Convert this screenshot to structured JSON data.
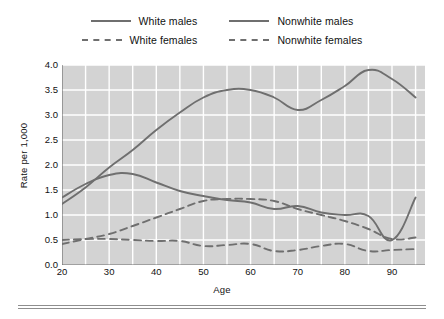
{
  "legend": {
    "entries": [
      {
        "label": "White males",
        "style": "solid"
      },
      {
        "label": "Nonwhite males",
        "style": "solid"
      },
      {
        "label": "White females",
        "style": "dashed"
      },
      {
        "label": "Nonwhite females",
        "style": "dashed"
      }
    ]
  },
  "axes": {
    "ylabel": "Rate per 1,000",
    "xlabel": "Age",
    "yticks": [
      "0.0",
      "0.5",
      "1.0",
      "1.5",
      "2.0",
      "2.5",
      "3.0",
      "3.5",
      "4.0"
    ],
    "xticks": [
      "20",
      "30",
      "40",
      "50",
      "60",
      "70",
      "80",
      "90"
    ]
  },
  "colors": {
    "line": "#6f6f6f",
    "plot_background": "#d3d3d3",
    "gridline": "#ffffff",
    "axis": "#6f6f6f",
    "text": "#111111"
  },
  "chart_data": {
    "type": "line",
    "title": "",
    "xlabel": "Age",
    "ylabel": "Rate per 1,000",
    "xlim": [
      20,
      97
    ],
    "ylim": [
      0.0,
      4.0
    ],
    "grid": true,
    "legend_position": "top",
    "x": [
      20,
      25,
      30,
      35,
      40,
      45,
      50,
      55,
      60,
      65,
      70,
      75,
      80,
      85,
      90,
      95
    ],
    "series": [
      {
        "name": "White males",
        "style": "solid",
        "values": [
          1.35,
          1.62,
          1.8,
          1.82,
          1.65,
          1.48,
          1.38,
          1.3,
          1.25,
          1.12,
          1.18,
          1.05,
          1.0,
          0.98,
          0.5,
          1.35
        ]
      },
      {
        "name": "Nonwhite males",
        "style": "solid",
        "values": [
          1.22,
          1.55,
          1.95,
          2.3,
          2.7,
          3.05,
          3.35,
          3.5,
          3.5,
          3.35,
          3.1,
          3.3,
          3.58,
          3.9,
          3.72,
          3.35
        ]
      },
      {
        "name": "White females",
        "style": "dashed",
        "values": [
          0.42,
          0.52,
          0.62,
          0.78,
          0.95,
          1.12,
          1.28,
          1.32,
          1.32,
          1.28,
          1.12,
          1.0,
          0.88,
          0.72,
          0.52,
          0.55
        ]
      },
      {
        "name": "Nonwhite females",
        "style": "dashed",
        "values": [
          0.5,
          0.52,
          0.52,
          0.5,
          0.48,
          0.48,
          0.38,
          0.4,
          0.42,
          0.28,
          0.3,
          0.38,
          0.42,
          0.28,
          0.3,
          0.32
        ]
      }
    ]
  }
}
